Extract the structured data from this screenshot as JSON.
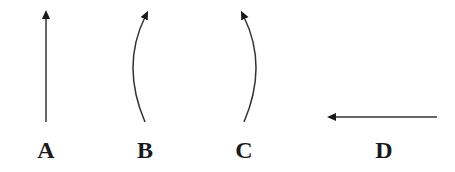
{
  "diagram": {
    "stroke_color": "#333333",
    "background": "#ffffff",
    "items": [
      {
        "label": "A",
        "kind": "straight-arrow",
        "direction": "up",
        "path": "M 46 122 L 46 17",
        "label_x": 46
      },
      {
        "label": "B",
        "kind": "curved-arrow",
        "direction": "up-right, curving left",
        "path": "M 145 122 Q 121 66 145 17",
        "label_x": 145
      },
      {
        "label": "C",
        "kind": "curved-arrow",
        "direction": "up-left, curving right",
        "path": "M 244 122 Q 268 66 244 17",
        "label_x": 244
      },
      {
        "label": "D",
        "kind": "straight-arrow",
        "direction": "left",
        "path": "M 437 117 L 334 117",
        "label_x": 384
      }
    ]
  }
}
